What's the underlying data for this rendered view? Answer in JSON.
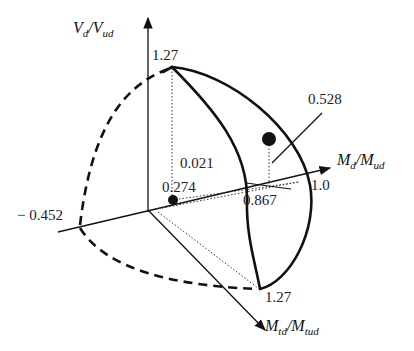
{
  "axes": {
    "vertical": {
      "label_main": "V",
      "label_sub": "d",
      "label_den_main": "V",
      "label_den_sub": "ud"
    },
    "horizontal": {
      "label_main": "M",
      "label_sub": "d",
      "label_den_main": "M",
      "label_den_sub": "ud"
    },
    "depth": {
      "label_main": "M",
      "label_sub": "td",
      "label_den_main": "M",
      "label_den_sub": "tud"
    }
  },
  "values": {
    "v_top": "1.27",
    "m_right": "1.0",
    "m_left": "− 0.452",
    "mt_bottom": "1.27",
    "point_a": "0.274",
    "point_b_m": "0.867",
    "point_b_mt": "0.021",
    "point_b_v": "0.528"
  },
  "colors": {
    "ink": "#111111",
    "background": "#ffffff"
  }
}
